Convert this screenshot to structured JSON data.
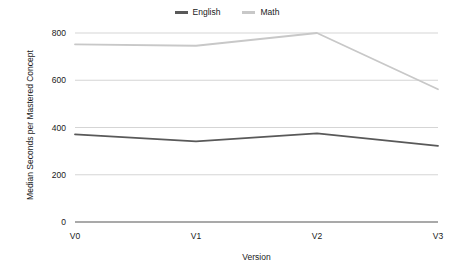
{
  "chart_data": {
    "type": "line",
    "title": "",
    "subtitle": "",
    "xlabel": "Version",
    "ylabel": "Median Seconds per Mastered Concept",
    "categories": [
      "V0",
      "V1",
      "V2",
      "V3"
    ],
    "x": [
      0,
      1,
      2,
      3
    ],
    "series": [
      {
        "name": "English",
        "color": "#595959",
        "values": [
          371,
          341,
          375,
          322
        ]
      },
      {
        "name": "Math",
        "color": "#c8c8c8",
        "values": [
          752,
          746,
          800,
          562
        ]
      }
    ],
    "ylim": [
      0,
      800
    ],
    "yticks": [
      0,
      200,
      400,
      600,
      800
    ],
    "ytick_labels": [
      "0",
      "200",
      "400",
      "600",
      "800"
    ],
    "xtick_labels": [
      "V0",
      "V1",
      "V2",
      "V3"
    ],
    "grid": {
      "horizontal": true,
      "vertical": false,
      "color": "#d0d0d0"
    },
    "legend": {
      "position": "top-center",
      "entries": [
        {
          "label": "English",
          "color": "#595959"
        },
        {
          "label": "Math",
          "color": "#c8c8c8"
        }
      ]
    },
    "axis": {
      "baseline_color": "#8c8c8c",
      "background": "#ffffff"
    }
  },
  "layout": {
    "plot_left": 75,
    "plot_right": 438,
    "plot_top": 33,
    "plot_bottom": 222
  }
}
